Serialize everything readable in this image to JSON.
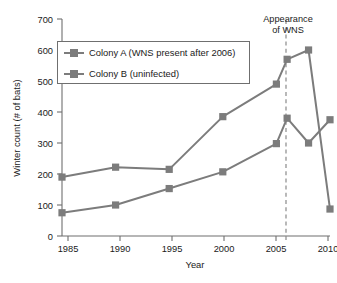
{
  "page": {
    "cut_off_header_text": "",
    "background_color": "#ffffff"
  },
  "chart_data": {
    "type": "line",
    "title": "",
    "xlabel": "Year",
    "ylabel": "Winter count (# of bats)",
    "xlim": [
      1985,
      2010
    ],
    "ylim": [
      0,
      700
    ],
    "xticks": [
      1985,
      1990,
      1995,
      2000,
      2005,
      2010
    ],
    "xtick_labels": [
      "1985",
      "1990",
      "1995",
      "2000",
      "2005",
      "2010"
    ],
    "yticks": [
      0,
      100,
      200,
      300,
      400,
      500,
      600,
      700
    ],
    "ytick_labels": [
      "0",
      "100",
      "200",
      "300",
      "400",
      "500",
      "600",
      "700"
    ],
    "grid": false,
    "legend_position": "upper-left",
    "series": [
      {
        "name": "Colony A (WNS present after 2006)",
        "color": "#7c7c7c",
        "marker": "square",
        "x": [
          1985,
          1990,
          1995,
          2000,
          2005,
          2006,
          2008,
          2010
        ],
        "values": [
          190,
          222,
          215,
          385,
          490,
          570,
          600,
          87
        ]
      },
      {
        "name": "Colony B (uninfected)",
        "color": "#7c7c7c",
        "marker": "square",
        "x": [
          1985,
          1990,
          1995,
          2000,
          2005,
          2006,
          2008,
          2010
        ],
        "values": [
          75,
          100,
          153,
          207,
          298,
          380,
          300,
          375
        ]
      }
    ],
    "annotations": [
      {
        "name": "appearance-of-wns",
        "line1": "Appearance",
        "line2": "of WNS",
        "x": 2006,
        "style": "dashed-vertical"
      }
    ]
  },
  "legend": {
    "items": [
      {
        "label": "Colony A (WNS present after 2006)",
        "color": "#7c7c7c"
      },
      {
        "label": "Colony B (uninfected)",
        "color": "#7c7c7c"
      }
    ]
  }
}
